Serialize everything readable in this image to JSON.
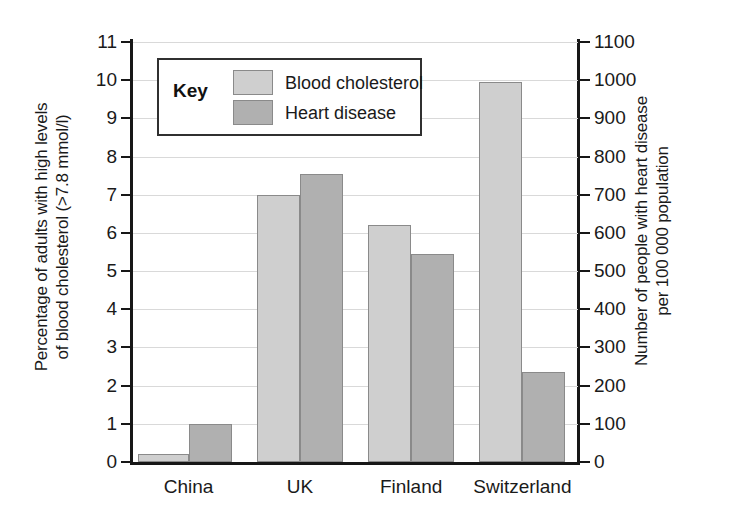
{
  "chart_data": {
    "type": "bar",
    "title": "",
    "categories": [
      "China",
      "UK",
      "Finland",
      "Switzerland"
    ],
    "series": [
      {
        "name": "Blood cholesterol",
        "axis": "left",
        "color": "#cfcfcf",
        "values": [
          0.2,
          7.0,
          6.2,
          9.95
        ]
      },
      {
        "name": "Heart disease",
        "axis": "right",
        "color": "#b0b0b0",
        "values": [
          100,
          755,
          545,
          235
        ]
      }
    ],
    "xlabel": "",
    "ylabel": "Percentage of adults with high levels of blood cholesterol (>7.8 mmol/l)",
    "y2label": "Number of people with heart disease per 100 000 population",
    "ylim": [
      0,
      11
    ],
    "y2lim": [
      0,
      1100
    ],
    "yticks": [
      0,
      1,
      2,
      3,
      4,
      5,
      6,
      7,
      8,
      9,
      10,
      11
    ],
    "y2ticks": [
      0,
      100,
      200,
      300,
      400,
      500,
      600,
      700,
      800,
      900,
      1000,
      1100
    ],
    "grid": true,
    "legend_position": "upper-left-inside"
  },
  "left_axis": {
    "title_lines": [
      "Percentage of adults with high levels",
      "of blood cholesterol (>7.8 mmol/l)"
    ],
    "tick_labels": [
      "11",
      "10",
      "9",
      "8",
      "7",
      "6",
      "5",
      "4",
      "3",
      "2",
      "1",
      "0"
    ]
  },
  "right_axis": {
    "title_lines": [
      "Number of people with heart disease",
      "per 100 000 population"
    ],
    "tick_labels": [
      "1100",
      "1000",
      "900",
      "800",
      "700",
      "600",
      "500",
      "400",
      "300",
      "200",
      "100",
      "0"
    ]
  },
  "x_axis": {
    "categories": [
      "China",
      "UK",
      "Finland",
      "Switzerland"
    ]
  },
  "legend": {
    "title": "Key",
    "entries": [
      {
        "label": "Blood cholesterol",
        "swatch": "light"
      },
      {
        "label": "Heart disease",
        "swatch": "dark"
      }
    ]
  }
}
